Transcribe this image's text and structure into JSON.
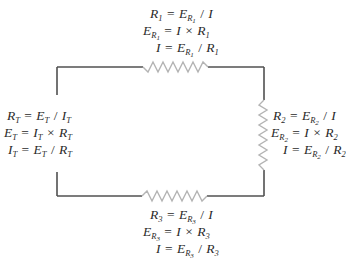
{
  "diagram": {
    "colors": {
      "wire": "#505050",
      "resistor": "#b0b0b0",
      "text": "#2a2a2a"
    },
    "components": {
      "R1": {
        "label": "R1",
        "position": "top",
        "equations": [
          {
            "lhs": "R",
            "lhs_sub": "1",
            "eq": "=",
            "rhs": [
              {
                "v": "E",
                "sub": "R",
                "subsub": "1"
              },
              {
                "op": "/"
              },
              {
                "v": "I"
              }
            ]
          },
          {
            "lhs": "E",
            "lhs_sub": "R",
            "lhs_subsub": "1",
            "eq": "=",
            "rhs": [
              {
                "v": "I"
              },
              {
                "op": "×"
              },
              {
                "v": "R",
                "sub": "1"
              }
            ]
          },
          {
            "lhs": "I",
            "eq": "=",
            "rhs": [
              {
                "v": "E",
                "sub": "R",
                "subsub": "1"
              },
              {
                "op": "/"
              },
              {
                "v": "R",
                "sub": "1"
              }
            ]
          }
        ]
      },
      "R2": {
        "label": "R2",
        "position": "right",
        "equations": [
          {
            "lhs": "R",
            "lhs_sub": "2",
            "eq": "=",
            "rhs": [
              {
                "v": "E",
                "sub": "R",
                "subsub": "2"
              },
              {
                "op": "/"
              },
              {
                "v": "I"
              }
            ]
          },
          {
            "lhs": "E",
            "lhs_sub": "R",
            "lhs_subsub": "2",
            "eq": "=",
            "rhs": [
              {
                "v": "I"
              },
              {
                "op": "×"
              },
              {
                "v": "R",
                "sub": "2"
              }
            ]
          },
          {
            "lhs": "I",
            "eq": "=",
            "rhs": [
              {
                "v": "E",
                "sub": "R",
                "subsub": "2"
              },
              {
                "op": "/"
              },
              {
                "v": "R",
                "sub": "2"
              }
            ]
          }
        ]
      },
      "R3": {
        "label": "R3",
        "position": "bottom",
        "equations": [
          {
            "lhs": "R",
            "lhs_sub": "3",
            "eq": "=",
            "rhs": [
              {
                "v": "E",
                "sub": "R",
                "subsub": "3"
              },
              {
                "op": "/"
              },
              {
                "v": "I"
              }
            ]
          },
          {
            "lhs": "E",
            "lhs_sub": "R",
            "lhs_subsub": "3",
            "eq": "=",
            "rhs": [
              {
                "v": "I"
              },
              {
                "op": "×"
              },
              {
                "v": "R",
                "sub": "3"
              }
            ]
          },
          {
            "lhs": "I",
            "eq": "=",
            "rhs": [
              {
                "v": "E",
                "sub": "R",
                "subsub": "3"
              },
              {
                "op": "/"
              },
              {
                "v": "R",
                "sub": "3"
              }
            ]
          }
        ]
      },
      "total": {
        "label": "Total",
        "position": "left",
        "equations": [
          {
            "lhs": "R",
            "lhs_sub": "T",
            "eq": "=",
            "rhs": [
              {
                "v": "E",
                "sub": "T"
              },
              {
                "op": "/"
              },
              {
                "v": "I",
                "sub": "T"
              }
            ]
          },
          {
            "lhs": "E",
            "lhs_sub": "T",
            "eq": "=",
            "rhs": [
              {
                "v": "I",
                "sub": "T"
              },
              {
                "op": "×"
              },
              {
                "v": "R",
                "sub": "T"
              }
            ]
          },
          {
            "lhs": "I",
            "lhs_sub": "T",
            "eq": "=",
            "rhs": [
              {
                "v": "E",
                "sub": "T"
              },
              {
                "op": "/"
              },
              {
                "v": "R",
                "sub": "T"
              }
            ]
          }
        ]
      }
    },
    "text": {
      "r1_l1_lhs": "R",
      "r1_l1_lhs_sub": "1",
      "r1_l1_e": "E",
      "r1_l1_e_sub": "R",
      "r1_l1_e_subsub": "1",
      "r1_l1_i": "I",
      "r1_l2_e": "E",
      "r1_l2_e_sub": "R",
      "r1_l2_e_subsub": "1",
      "r1_l2_i": "I",
      "r1_l2_r": "R",
      "r1_l2_r_sub": "1",
      "r1_l3_i": "I",
      "r1_l3_e": "E",
      "r1_l3_e_sub": "R",
      "r1_l3_e_subsub": "1",
      "r1_l3_r": "R",
      "r1_l3_r_sub": "1",
      "r2_l1_lhs": "R",
      "r2_l1_lhs_sub": "2",
      "r2_l1_e": "E",
      "r2_l1_e_sub": "R",
      "r2_l1_e_subsub": "2",
      "r2_l1_i": "I",
      "r2_l2_e": "E",
      "r2_l2_e_sub": "R",
      "r2_l2_e_subsub": "2",
      "r2_l2_i": "I",
      "r2_l2_r": "R",
      "r2_l2_r_sub": "2",
      "r2_l3_i": "I",
      "r2_l3_e": "E",
      "r2_l3_e_sub": "R",
      "r2_l3_e_subsub": "2",
      "r2_l3_r": "R",
      "r2_l3_r_sub": "2",
      "r3_l1_lhs": "R",
      "r3_l1_lhs_sub": "3",
      "r3_l1_e": "E",
      "r3_l1_e_sub": "R",
      "r3_l1_e_subsub": "3",
      "r3_l1_i": "I",
      "r3_l2_e": "E",
      "r3_l2_e_sub": "R",
      "r3_l2_e_subsub": "3",
      "r3_l2_i": "I",
      "r3_l2_r": "R",
      "r3_l2_r_sub": "3",
      "r3_l3_i": "I",
      "r3_l3_e": "E",
      "r3_l3_e_sub": "R",
      "r3_l3_e_subsub": "3",
      "r3_l3_r": "R",
      "r3_l3_r_sub": "3",
      "t_l1_r": "R",
      "t_l1_r_sub": "T",
      "t_l1_e": "E",
      "t_l1_e_sub": "T",
      "t_l1_i": "I",
      "t_l1_i_sub": "T",
      "t_l2_e": "E",
      "t_l2_e_sub": "T",
      "t_l2_i": "I",
      "t_l2_i_sub": "T",
      "t_l2_r": "R",
      "t_l2_r_sub": "T",
      "t_l3_i": "I",
      "t_l3_i_sub": "T",
      "t_l3_e": "E",
      "t_l3_e_sub": "T",
      "t_l3_r": "R",
      "t_l3_r_sub": "T",
      "eq": "=",
      "div": "/",
      "times": "×"
    }
  }
}
